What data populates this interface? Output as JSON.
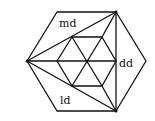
{
  "diagram": {
    "labels": {
      "top": "md",
      "right": "dd",
      "bottom": "ld"
    },
    "outer_hexagon": [
      [
        57,
        12
      ],
      [
        116,
        12
      ],
      [
        146,
        61
      ],
      [
        116,
        111
      ],
      [
        57,
        111
      ],
      [
        27,
        61
      ]
    ],
    "inner_hexagon": [
      [
        72,
        37
      ],
      [
        102,
        37
      ],
      [
        116,
        61
      ],
      [
        102,
        86
      ],
      [
        72,
        86
      ],
      [
        57,
        61
      ]
    ],
    "center": [
      87,
      61
    ],
    "colors": {
      "line": "#111111",
      "background": "#ffffff"
    }
  }
}
